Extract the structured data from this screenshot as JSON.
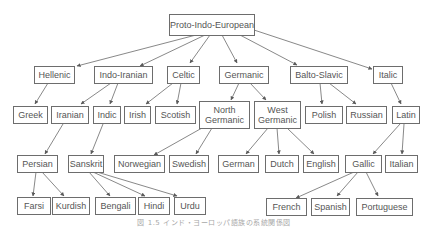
{
  "diagram": {
    "caption": "図 1.5 インド・ヨーロッパ語族の系統関係図",
    "colors": {
      "border": "#6d6d6d",
      "text": "#555555",
      "edge": "#5a5a5a",
      "background": "#ffffff"
    },
    "nodes": {
      "root": "Proto-Indo-European",
      "hellenic": "Hellenic",
      "indo_iranian": "Indo-Iranian",
      "celtic": "Celtic",
      "germanic": "Germanic",
      "balto_slavic": "Balto-Slavic",
      "italic": "Italic",
      "greek": "Greek",
      "iranian": "Iranian",
      "indic": "Indic",
      "irish": "Irish",
      "scotish": "Scotish",
      "north_germanic": "North Germanic",
      "west_germanic": "West Germanic",
      "polish": "Polish",
      "russian": "Russian",
      "latin": "Latin",
      "persian": "Persian",
      "sanskrit": "Sanskrit",
      "norwegian": "Norwegian",
      "swedish": "Swedish",
      "german": "German",
      "dutch": "Dutch",
      "english": "English",
      "gallic": "Gallic",
      "italian": "Italian",
      "farsi": "Farsi",
      "kurdish": "Kurdish",
      "bengali": "Bengali",
      "hindi": "Hindi",
      "urdu": "Urdu",
      "french": "French",
      "spanish": "Spanish",
      "portuguese": "Portuguese"
    },
    "edges": [
      [
        "root",
        "hellenic"
      ],
      [
        "root",
        "indo_iranian"
      ],
      [
        "root",
        "celtic"
      ],
      [
        "root",
        "germanic"
      ],
      [
        "root",
        "balto_slavic"
      ],
      [
        "root",
        "italic"
      ],
      [
        "hellenic",
        "greek"
      ],
      [
        "indo_iranian",
        "iranian"
      ],
      [
        "indo_iranian",
        "indic"
      ],
      [
        "celtic",
        "irish"
      ],
      [
        "celtic",
        "scotish"
      ],
      [
        "germanic",
        "north_germanic"
      ],
      [
        "germanic",
        "west_germanic"
      ],
      [
        "balto_slavic",
        "polish"
      ],
      [
        "balto_slavic",
        "russian"
      ],
      [
        "italic",
        "latin"
      ],
      [
        "iranian",
        "persian"
      ],
      [
        "indic",
        "sanskrit"
      ],
      [
        "north_germanic",
        "norwegian"
      ],
      [
        "north_germanic",
        "swedish"
      ],
      [
        "west_germanic",
        "german"
      ],
      [
        "west_germanic",
        "dutch"
      ],
      [
        "west_germanic",
        "english"
      ],
      [
        "latin",
        "gallic"
      ],
      [
        "latin",
        "italian"
      ],
      [
        "persian",
        "farsi"
      ],
      [
        "persian",
        "kurdish"
      ],
      [
        "sanskrit",
        "bengali"
      ],
      [
        "sanskrit",
        "hindi"
      ],
      [
        "sanskrit",
        "urdu"
      ],
      [
        "gallic",
        "french"
      ],
      [
        "gallic",
        "spanish"
      ],
      [
        "gallic",
        "portuguese"
      ]
    ]
  }
}
